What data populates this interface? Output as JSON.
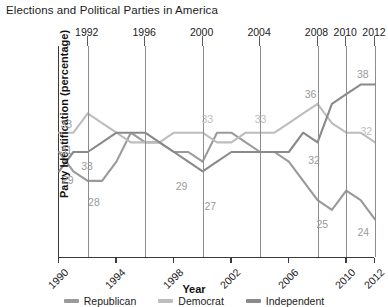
{
  "title": "Elections and Political Parties in America",
  "axes": {
    "xlabel": "Year",
    "ylabel": "Party Identification (percentage)",
    "top_ticks": [
      "1992",
      "1996",
      "2000",
      "2004",
      "2008",
      "2010",
      "2012"
    ],
    "bottom_ticks": [
      "1990",
      "1994",
      "1998",
      "2002",
      "2006",
      "2010",
      "2012"
    ]
  },
  "legend": {
    "items": [
      {
        "label": "Republican",
        "color": "#9a9a9a"
      },
      {
        "label": "Democrat",
        "color": "#bdbdbd"
      },
      {
        "label": "Independent",
        "color": "#8a8a8a"
      }
    ]
  },
  "colors": {
    "republican": "#9a9a9a",
    "democrat": "#bdbdbd",
    "independent": "#8a8a8a",
    "axis": "#3a3a3a",
    "grid": "#8d8d8d",
    "label_text": "#9a9a9a",
    "title_text": "#1b1b1b"
  },
  "annotations": [
    {
      "text": "33",
      "x": 1990.3,
      "y": 33.0,
      "dx": 4,
      "dy": -9,
      "color": "#9a9a9a"
    },
    {
      "text": "31",
      "x": 1990.3,
      "y": 31.0,
      "dx": 4,
      "dy": -2,
      "color": "#9a9a9a"
    },
    {
      "text": "29",
      "x": 1990.4,
      "y": 29.0,
      "dx": 4,
      "dy": 9,
      "color": "#9a9a9a"
    },
    {
      "text": "33",
      "x": 1991.6,
      "y": 30.6,
      "dx": 6,
      "dy": 10,
      "color": "#9a9a9a"
    },
    {
      "text": "28",
      "x": 1992.5,
      "y": 27.4,
      "dx": 0,
      "dy": 15,
      "color": "#9a9a9a"
    },
    {
      "text": "29",
      "x": 1998.6,
      "y": 29.0,
      "dx": 0,
      "dy": 15,
      "color": "#9a9a9a"
    },
    {
      "text": "27",
      "x": 2000.6,
      "y": 27.0,
      "dx": 0,
      "dy": 15,
      "color": "#9a9a9a"
    },
    {
      "text": "33",
      "x": 2000.4,
      "y": 33.3,
      "dx": 0,
      "dy": -11,
      "color": "#bdbdbd"
    },
    {
      "text": "33",
      "x": 2004.1,
      "y": 33.3,
      "dx": 0,
      "dy": -11,
      "color": "#bdbdbd"
    },
    {
      "text": "36",
      "x": 2008.0,
      "y": 35.9,
      "dx": -6,
      "dy": -11,
      "color": "#9a9a9a"
    },
    {
      "text": "32",
      "x": 2008.1,
      "y": 31.6,
      "dx": -4,
      "dy": 14,
      "color": "#9a9a9a"
    },
    {
      "text": "38",
      "x": 2011.5,
      "y": 38.0,
      "dx": -4,
      "dy": -11,
      "color": "#9a9a9a"
    },
    {
      "text": "32",
      "x": 2011.6,
      "y": 32.1,
      "dx": -2,
      "dy": -10,
      "color": "#bdbdbd"
    },
    {
      "text": "25",
      "x": 2008.4,
      "y": 25.0,
      "dx": 0,
      "dy": 14,
      "color": "#9a9a9a"
    },
    {
      "text": "24",
      "x": 2011.4,
      "y": 24.1,
      "dx": -2,
      "dy": 14,
      "color": "#9a9a9a"
    }
  ],
  "chart_data": {
    "type": "line",
    "title": "Elections and Political Parties in America",
    "xlabel": "Year",
    "ylabel": "Party Identification (percentage)",
    "xlim": [
      1990,
      2012
    ],
    "ylim": [
      20,
      42
    ],
    "grid": "vertical gridlines at election years",
    "legend_position": "bottom-center",
    "x": [
      1990,
      1991,
      1992,
      1993,
      1994,
      1995,
      1996,
      1997,
      1998,
      1999,
      2000,
      2001,
      2002,
      2003,
      2004,
      2005,
      2006,
      2007,
      2008,
      2009,
      2010,
      2011,
      2012
    ],
    "series": [
      {
        "name": "Republican",
        "color": "#9a9a9a",
        "values": [
          31,
          29,
          28,
          28,
          30,
          33,
          32,
          32,
          31,
          31,
          30,
          33,
          33,
          32,
          31,
          31,
          30,
          28,
          26,
          25,
          27,
          26,
          24
        ]
      },
      {
        "name": "Democrat",
        "color": "#bdbdbd",
        "values": [
          33,
          33,
          35,
          34,
          33,
          32,
          32,
          32,
          33,
          33,
          33,
          32,
          32,
          33,
          33,
          33,
          34,
          35,
          36,
          34,
          33,
          33,
          32
        ]
      },
      {
        "name": "Independent",
        "color": "#8a8a8a",
        "values": [
          29,
          31,
          31,
          32,
          33,
          33,
          33,
          32,
          31,
          30,
          29,
          30,
          31,
          31,
          31,
          31,
          31,
          33,
          32,
          36,
          37,
          38,
          38
        ]
      }
    ],
    "data_labels": [
      33,
      31,
      29,
      33,
      28,
      29,
      27,
      33,
      33,
      36,
      32,
      38,
      32,
      25,
      24
    ]
  }
}
